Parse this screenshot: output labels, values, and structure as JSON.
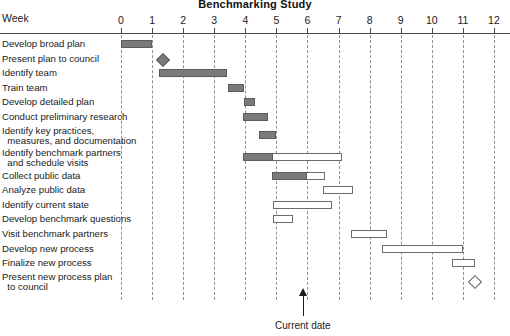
{
  "chart_data": {
    "type": "bar",
    "title": "Benchmarking Study",
    "subtitle": "",
    "xlabel": "Week",
    "ylabel": "",
    "xlim": [
      0,
      12
    ],
    "grid": true,
    "legend": null,
    "row_axis_label": "Week",
    "tick_labels": [
      "0",
      "1",
      "2",
      "3",
      "4",
      "5",
      "6",
      "7",
      "8",
      "9",
      "10",
      "11",
      "12"
    ],
    "tick_values": [
      0,
      1,
      2,
      3,
      4,
      5,
      6,
      7,
      8,
      9,
      10,
      11,
      12
    ],
    "annotations": [
      {
        "name": "current-date",
        "label": "Current date",
        "week": 5.85
      }
    ],
    "categories": [
      "Develop broad plan",
      "Present plan to council",
      "Identify team",
      "Train team",
      "Develop detailed plan",
      "Conduct preliminary research",
      "Identify key practices,\n  measures, and documentation",
      "Identify benchmark partners\n  and schedule visits",
      "Collect public data",
      "Analyze public data",
      "Identify current state",
      "Develop benchmark questions",
      "Visit benchmark partners",
      "Develop new process",
      "Finalize new process",
      "Present new process plan\n  to council"
    ],
    "tasks": [
      {
        "label": "Develop broad plan",
        "kind": "bar",
        "start": 0.0,
        "end": 1.0,
        "complete_to": 1.0
      },
      {
        "label": "Present plan to council",
        "kind": "milestone",
        "at": 1.35,
        "filled": true
      },
      {
        "label": "Identify team",
        "kind": "bar",
        "start": 1.22,
        "end": 3.4,
        "complete_to": 3.4
      },
      {
        "label": "Train team",
        "kind": "bar",
        "start": 3.43,
        "end": 3.95,
        "complete_to": 3.95
      },
      {
        "label": "Develop detailed plan",
        "kind": "bar",
        "start": 3.95,
        "end": 4.3,
        "complete_to": 4.3
      },
      {
        "label": "Conduct preliminary research",
        "kind": "bar",
        "start": 3.93,
        "end": 4.72,
        "complete_to": 4.72
      },
      {
        "label": "Identify key practices, measures, and documentation",
        "kind": "bar",
        "start": 4.45,
        "end": 5.0,
        "complete_to": 5.0
      },
      {
        "label": "Identify benchmark partners and schedule visits",
        "kind": "bar",
        "start": 3.93,
        "end": 7.1,
        "complete_to": 4.9
      },
      {
        "label": "Collect public data",
        "kind": "bar",
        "start": 4.85,
        "end": 6.55,
        "complete_to": 6.0
      },
      {
        "label": "Analyze public data",
        "kind": "bar",
        "start": 6.5,
        "end": 7.45,
        "complete_to": 6.5
      },
      {
        "label": "Identify current state",
        "kind": "bar",
        "start": 4.88,
        "end": 6.8,
        "complete_to": 4.88
      },
      {
        "label": "Develop benchmark questions",
        "kind": "bar",
        "start": 4.9,
        "end": 5.55,
        "complete_to": 4.9
      },
      {
        "label": "Visit benchmark partners",
        "kind": "bar",
        "start": 7.4,
        "end": 8.55,
        "complete_to": 7.4
      },
      {
        "label": "Develop new process",
        "kind": "bar",
        "start": 8.4,
        "end": 11.0,
        "complete_to": 8.4
      },
      {
        "label": "Finalize new process",
        "kind": "bar",
        "start": 10.65,
        "end": 11.4,
        "complete_to": 10.65
      },
      {
        "label": "Present new process plan to council",
        "kind": "milestone",
        "at": 11.4,
        "filled": false
      }
    ]
  },
  "colors": {
    "bar_fill": "#7a7a7a",
    "bar_border": "#5c5c5c",
    "bar_outline": "#6b6b6b",
    "gridline": "#8f8f8f",
    "axis": "#4a4a4a",
    "text": "#1a1a1a",
    "background": "#ffffff"
  }
}
